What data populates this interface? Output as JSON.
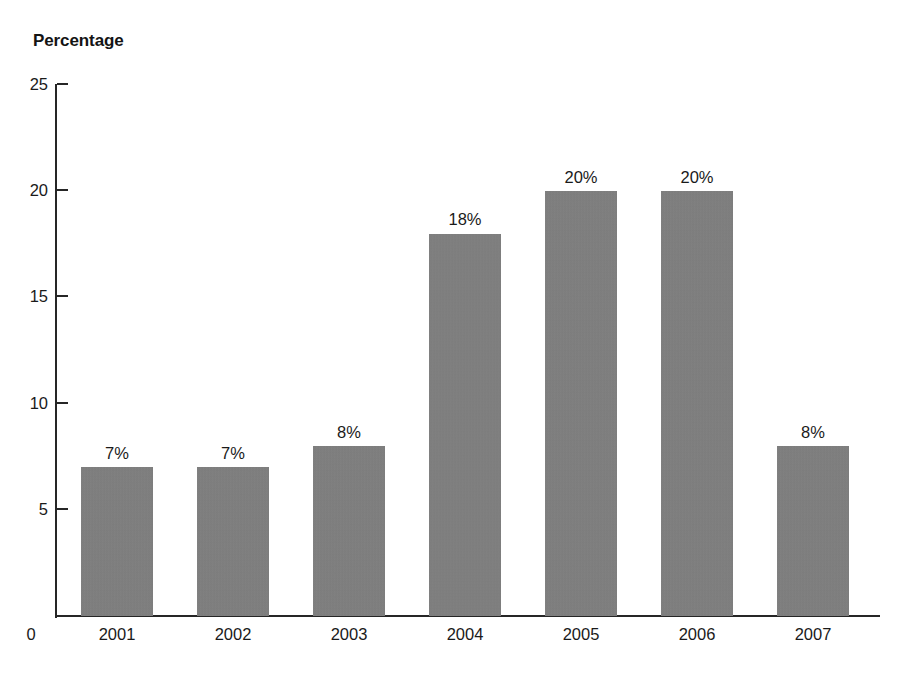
{
  "chart_data": {
    "type": "bar",
    "title": "",
    "ylabel": "Percentage",
    "xlabel": "",
    "categories": [
      "2001",
      "2002",
      "2003",
      "2004",
      "2005",
      "2006",
      "2007"
    ],
    "values": [
      7,
      7,
      8,
      18,
      20,
      20,
      8
    ],
    "data_labels": [
      "7%",
      "7%",
      "8%",
      "18%",
      "20%",
      "20%",
      "8%"
    ],
    "ylim": [
      0,
      25
    ],
    "y_ticks": [
      25,
      20,
      15,
      10,
      5
    ],
    "y_tick_labels": [
      "25",
      "20",
      "15",
      "10",
      "5"
    ],
    "zero_label": "0",
    "grid": false,
    "legend": false,
    "bar_color": "#808080",
    "axis_color": "#262626",
    "background_color": "#ffffff"
  }
}
